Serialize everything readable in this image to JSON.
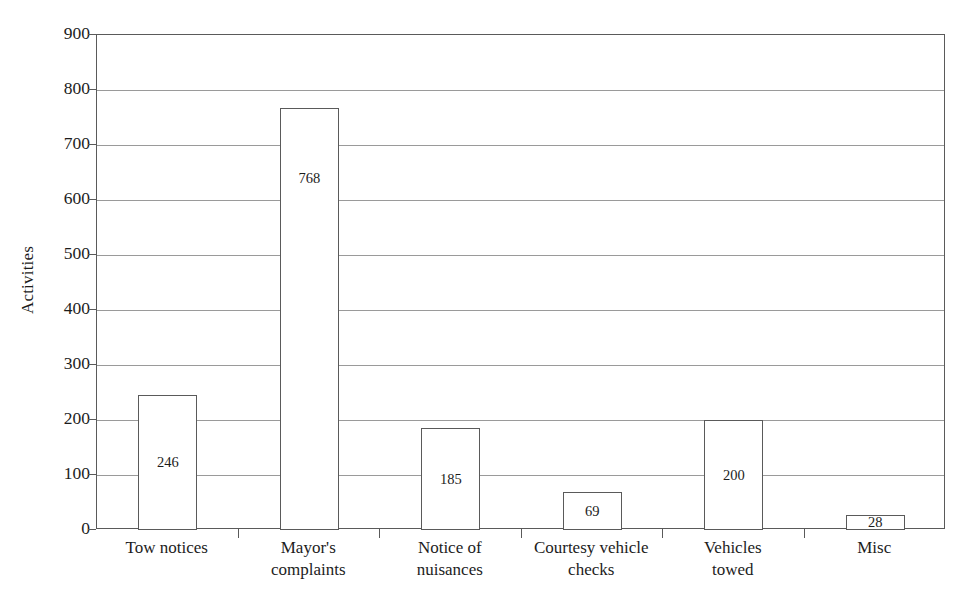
{
  "chart_data": {
    "type": "bar",
    "title": "",
    "subtitle": "",
    "xlabel": "",
    "ylabel": "Activities",
    "ylim": [
      0,
      900
    ],
    "ytick_step": 100,
    "yticks": [
      900,
      800,
      700,
      600,
      500,
      400,
      300,
      200,
      100,
      0
    ],
    "ytick_labels": [
      "900",
      "800",
      "700",
      "600",
      "500",
      "400",
      "300",
      "200",
      "100",
      "0"
    ],
    "grid": true,
    "grid_axis": "y",
    "legend": null,
    "legend_position": "none",
    "bar_style": {
      "fill_color": "#ffffff",
      "edge_color": "#5a5a5a",
      "value_label_position": "inside"
    },
    "categories": [
      "Tow notices",
      "Mayor's complaints",
      "Notice of nuisances",
      "Courtesy vehicle checks",
      "Vehicles towed",
      "Misc"
    ],
    "category_label_lines": [
      [
        "Tow notices",
        ""
      ],
      [
        "Mayor's",
        "complaints"
      ],
      [
        "Notice of",
        "nuisances"
      ],
      [
        "Courtesy vehicle",
        "checks"
      ],
      [
        "Vehicles",
        "towed"
      ],
      [
        "Misc",
        ""
      ]
    ],
    "values": [
      246,
      768,
      185,
      69,
      200,
      28
    ],
    "value_labels": [
      "246",
      "768",
      "185",
      "69",
      "200",
      "28"
    ],
    "series": [
      {
        "name": "Activities",
        "values": [
          246,
          768,
          185,
          69,
          200,
          28
        ]
      }
    ]
  }
}
